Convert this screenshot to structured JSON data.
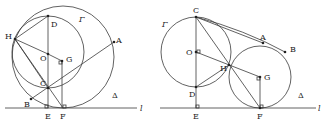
{
  "figures": [
    {
      "id": "left",
      "line_label": "l",
      "circle_big_label": "Γ",
      "circle_small_label": "Δ",
      "points": {
        "H": "H",
        "D": "D",
        "O": "O",
        "G": "G",
        "C": "C",
        "A": "A",
        "B": "B",
        "E": "E",
        "F": "F"
      }
    },
    {
      "id": "right",
      "line_label": "l",
      "circle_left_label": "Γ",
      "circle_right_label": "Δ",
      "points": {
        "C": "C",
        "O": "O",
        "D": "D",
        "E": "E",
        "H": "H",
        "G": "G",
        "F": "F",
        "A": "A",
        "B": "B"
      }
    }
  ]
}
